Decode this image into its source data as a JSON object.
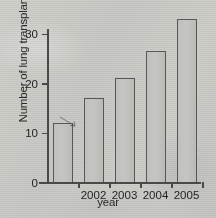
{
  "chart_data": {
    "type": "bar",
    "title": "",
    "xlabel": "year",
    "ylabel": "Number of lung transplants",
    "categories": [
      "",
      "2002",
      "2003",
      "2004",
      "2005"
    ],
    "values": [
      12,
      17,
      21,
      26.5,
      33
    ],
    "ylim": [
      0,
      35
    ],
    "yticks": [
      0,
      10,
      20,
      30
    ],
    "ytick_labels": [
      "0",
      "10",
      "20",
      "30"
    ],
    "xtick_labels": [
      "",
      "2002",
      "2003",
      "2004",
      "2005"
    ],
    "grid": false,
    "legend": null
  },
  "figure": {
    "axis_color": "#4a4a4a",
    "bar_fill": "#bfbfbb",
    "bar_edge": "#585858",
    "background": "#c9c9c6",
    "text_color": "#242424"
  }
}
